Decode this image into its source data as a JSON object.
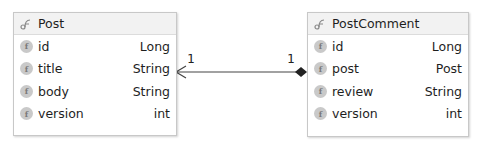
{
  "entities": [
    {
      "name": "Post",
      "icon": "class-icon",
      "fields": [
        {
          "name": "id",
          "type": "Long",
          "icon": "field-icon"
        },
        {
          "name": "title",
          "type": "String",
          "icon": "field-icon"
        },
        {
          "name": "body",
          "type": "String",
          "icon": "field-icon"
        },
        {
          "name": "version",
          "type": "int",
          "icon": "field-icon"
        }
      ]
    },
    {
      "name": "PostComment",
      "icon": "class-icon",
      "fields": [
        {
          "name": "id",
          "type": "Long",
          "icon": "field-icon"
        },
        {
          "name": "post",
          "type": "Post",
          "icon": "field-icon"
        },
        {
          "name": "review",
          "type": "String",
          "icon": "field-icon"
        },
        {
          "name": "version",
          "type": "int",
          "icon": "field-icon"
        }
      ]
    }
  ],
  "association": {
    "from": "PostComment",
    "to": "Post",
    "source_multiplicity": "1",
    "target_multiplicity": "1",
    "source_end": "composition-diamond",
    "target_end": "open-arrow"
  },
  "field_icon_letter": "f",
  "colors": {
    "border": "#c8c8c8",
    "header_bg": "#f2f2f2",
    "field_icon_bg": "#c9c9c9",
    "line": "#444444"
  }
}
